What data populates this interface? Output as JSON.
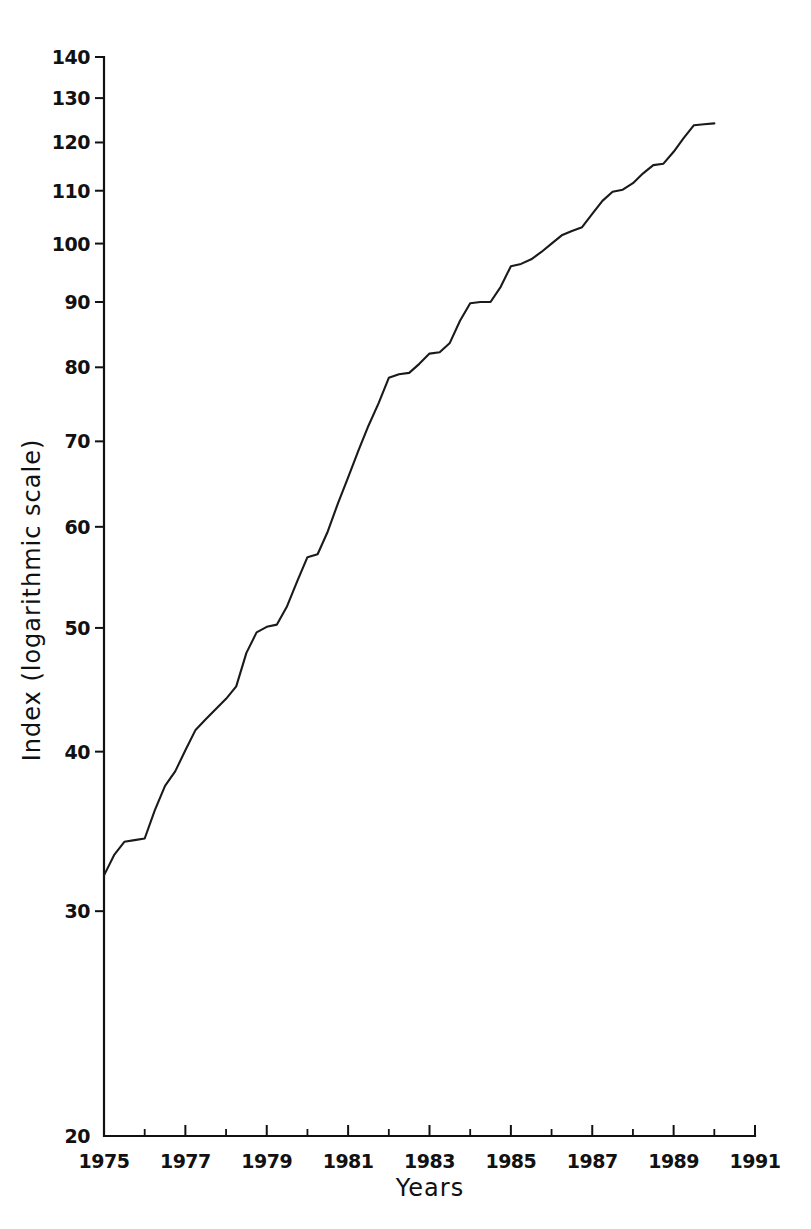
{
  "chart_data": {
    "type": "line",
    "title": "",
    "xlabel": "Years",
    "ylabel": "Index (logarithmic scale)",
    "yscale": "log",
    "xscale": "linear",
    "grid": false,
    "legend": false,
    "xlim": [
      1975,
      1991
    ],
    "ylim": [
      20,
      140
    ],
    "ytick_labels": [
      "140",
      "130",
      "120",
      "110",
      "100",
      "90",
      "80",
      "70",
      "60",
      "50",
      "40",
      "30",
      "20"
    ],
    "ytick_values": [
      140,
      130,
      120,
      110,
      100,
      90,
      80,
      70,
      60,
      50,
      40,
      30,
      20
    ],
    "xtick_labels": [
      "1975",
      "1977",
      "1979",
      "1981",
      "1983",
      "1985",
      "1987",
      "1989",
      "1991"
    ],
    "xtick_values": [
      1975,
      1977,
      1979,
      1981,
      1983,
      1985,
      1987,
      1989,
      1991
    ],
    "xtick_minor_values": [
      1976,
      1978,
      1980,
      1982,
      1984,
      1986,
      1988,
      1990
    ],
    "series": [
      {
        "name": "Index",
        "x": [
          1975.0,
          1975.25,
          1975.5,
          1975.75,
          1976.0,
          1976.25,
          1976.5,
          1976.75,
          1977.0,
          1977.25,
          1977.5,
          1977.75,
          1978.0,
          1978.25,
          1978.5,
          1978.75,
          1979.0,
          1979.25,
          1979.5,
          1979.75,
          1980.0,
          1980.25,
          1980.5,
          1980.75,
          1981.0,
          1981.25,
          1981.5,
          1981.75,
          1982.0,
          1982.25,
          1982.5,
          1982.75,
          1983.0,
          1983.25,
          1983.5,
          1983.75,
          1984.0,
          1984.25,
          1984.5,
          1984.75,
          1985.0,
          1985.25,
          1985.5,
          1985.75,
          1986.0,
          1986.25,
          1986.5,
          1986.75,
          1987.0,
          1987.25,
          1987.5,
          1987.75,
          1988.0,
          1988.25,
          1988.5,
          1988.75,
          1989.0,
          1989.25,
          1989.5,
          1989.75,
          1990.0
        ],
        "y": [
          32.0,
          33.2,
          34.0,
          34.1,
          34.2,
          36.0,
          37.6,
          38.6,
          40.1,
          41.6,
          42.4,
          43.2,
          44.0,
          45.0,
          47.8,
          49.6,
          50.1,
          50.3,
          52.0,
          54.4,
          56.8,
          57.1,
          59.5,
          62.6,
          65.6,
          68.8,
          72.0,
          75.0,
          78.5,
          79.0,
          79.2,
          80.5,
          82.0,
          82.2,
          83.6,
          87.0,
          89.8,
          90.0,
          90.0,
          92.5,
          96.0,
          96.4,
          97.2,
          98.5,
          100.0,
          101.5,
          102.3,
          103.0,
          105.5,
          108.0,
          109.8,
          110.2,
          111.5,
          113.5,
          115.2,
          115.5,
          118.0,
          121.0,
          123.8,
          124.0,
          124.2
        ]
      }
    ],
    "annotations": []
  },
  "axis": {
    "y_title": "Index (logarithmic scale)",
    "x_title": "Years"
  }
}
